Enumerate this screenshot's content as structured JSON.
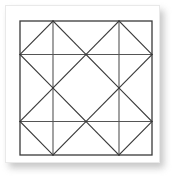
{
  "figure": {
    "pattern_name": "Ohio Star / Sawtooth Star quilt block"
  },
  "card": {
    "background_color": "#ffffff",
    "border_color": "#e9e9e9",
    "shadow_color": "#9a9a9a"
  },
  "block": {
    "stroke_color": "#3a3a3a",
    "grid_stroke_color": "#555555",
    "fill_color": "#ffffff",
    "stroke_width": 1.1,
    "outer_stroke_width": 1.3,
    "grid_divisions": 4,
    "bounds": {
      "x": 20,
      "y": 21,
      "width": 132,
      "height": 134
    }
  },
  "chart_data": {
    "type": "diagram",
    "geometry": "square subdivided 4x4 with diagonals",
    "unit_grid": {
      "columns": 4,
      "rows": 4
    },
    "grid_lines": {
      "vertical_fractions": [
        0.25,
        0.75
      ],
      "horizontal_fractions": [
        0.25,
        0.75
      ]
    },
    "diagonal_segments": [
      {
        "name": "top-left-corner-diagonal",
        "from": [
          0.25,
          0.0
        ],
        "to": [
          0.0,
          0.25
        ]
      },
      {
        "name": "top-right-corner-diagonal",
        "from": [
          0.75,
          0.0
        ],
        "to": [
          1.0,
          0.25
        ]
      },
      {
        "name": "bottom-left-corner-diagonal",
        "from": [
          0.0,
          0.75
        ],
        "to": [
          0.25,
          1.0
        ]
      },
      {
        "name": "bottom-right-corner-diagonal",
        "from": [
          0.75,
          1.0
        ],
        "to": [
          1.0,
          0.75
        ]
      },
      {
        "name": "top-star-point-left",
        "from": [
          0.25,
          0.0
        ],
        "to": [
          0.5,
          0.25
        ]
      },
      {
        "name": "top-star-point-right",
        "from": [
          0.75,
          0.0
        ],
        "to": [
          0.5,
          0.25
        ]
      },
      {
        "name": "bottom-star-point-left",
        "from": [
          0.25,
          1.0
        ],
        "to": [
          0.5,
          0.75
        ]
      },
      {
        "name": "bottom-star-point-right",
        "from": [
          0.75,
          1.0
        ],
        "to": [
          0.5,
          0.75
        ]
      },
      {
        "name": "left-star-point-top",
        "from": [
          0.0,
          0.25
        ],
        "to": [
          0.25,
          0.5
        ]
      },
      {
        "name": "left-star-point-bottom",
        "from": [
          0.0,
          0.75
        ],
        "to": [
          0.25,
          0.5
        ]
      },
      {
        "name": "right-star-point-top",
        "from": [
          1.0,
          0.25
        ],
        "to": [
          0.75,
          0.5
        ]
      },
      {
        "name": "right-star-point-bottom",
        "from": [
          1.0,
          0.75
        ],
        "to": [
          0.75,
          0.5
        ]
      },
      {
        "name": "center-diamond-upper-left",
        "from": [
          0.25,
          0.5
        ],
        "to": [
          0.5,
          0.25
        ]
      },
      {
        "name": "center-diamond-upper-right",
        "from": [
          0.5,
          0.25
        ],
        "to": [
          0.75,
          0.5
        ]
      },
      {
        "name": "center-diamond-lower-right",
        "from": [
          0.75,
          0.5
        ],
        "to": [
          0.5,
          0.75
        ]
      },
      {
        "name": "center-diamond-lower-left",
        "from": [
          0.5,
          0.75
        ],
        "to": [
          0.25,
          0.5
        ]
      }
    ],
    "vertices_of_interest": [
      {
        "name": "top-mid-notch",
        "at": [
          0.5,
          0.25
        ]
      },
      {
        "name": "bottom-mid-notch",
        "at": [
          0.5,
          0.75
        ]
      },
      {
        "name": "left-mid-notch",
        "at": [
          0.25,
          0.5
        ]
      },
      {
        "name": "right-mid-notch",
        "at": [
          0.75,
          0.5
        ]
      }
    ]
  }
}
